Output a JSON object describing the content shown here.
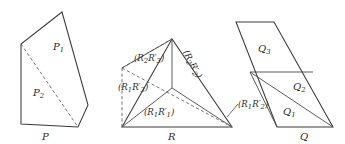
{
  "figure": {
    "kind": "geometric-dissection-diagram",
    "background_color": "#ffffff",
    "line_color": "#4a4a4a",
    "text_color": "#2b2b2b",
    "panels": [
      {
        "id": "panel-p",
        "caption": "P",
        "shape": "pentagon",
        "regions": [
          {
            "id": "p1",
            "label": "P",
            "sub": "1"
          },
          {
            "id": "p2",
            "label": "P",
            "sub": "2"
          }
        ]
      },
      {
        "id": "panel-r",
        "caption": "R",
        "shape": "triangle",
        "regions": [
          {
            "id": "r-upper-left",
            "text": "(R2R'3)"
          },
          {
            "id": "r-left",
            "text": "(R1R'3)"
          },
          {
            "id": "r-bottom",
            "text": "(R1R'1)"
          },
          {
            "id": "r-upper-right",
            "text": "(R2R'2)"
          },
          {
            "id": "r-callout",
            "text": "(R1R'2)"
          }
        ]
      },
      {
        "id": "panel-q",
        "caption": "Q",
        "shape": "parallelogram",
        "regions": [
          {
            "id": "q3",
            "label": "Q",
            "sub": "3"
          },
          {
            "id": "q2",
            "label": "Q",
            "sub": "2"
          },
          {
            "id": "q1",
            "label": "Q",
            "sub": "1"
          }
        ]
      }
    ],
    "labels": {
      "p_caption": "P",
      "r_caption": "R",
      "q_caption": "Q",
      "p1_base": "P",
      "p1_sub": "1",
      "p2_base": "P",
      "p2_sub": "2",
      "q1_base": "Q",
      "q1_sub": "1",
      "q2_base": "Q",
      "q2_sub": "2",
      "q3_base": "Q",
      "q3_sub": "3",
      "r_open": "(",
      "r_close": ")",
      "r_R": "R",
      "r_prime": "′",
      "r2r3_s1": "2",
      "r2r3_s2": "3",
      "r1r3_s1": "1",
      "r1r3_s2": "3",
      "r1r1_s1": "1",
      "r1r1_s2": "1",
      "r2r2_s1": "2",
      "r2r2_s2": "2",
      "r1r2_s1": "1",
      "r1r2_s2": "2"
    }
  }
}
